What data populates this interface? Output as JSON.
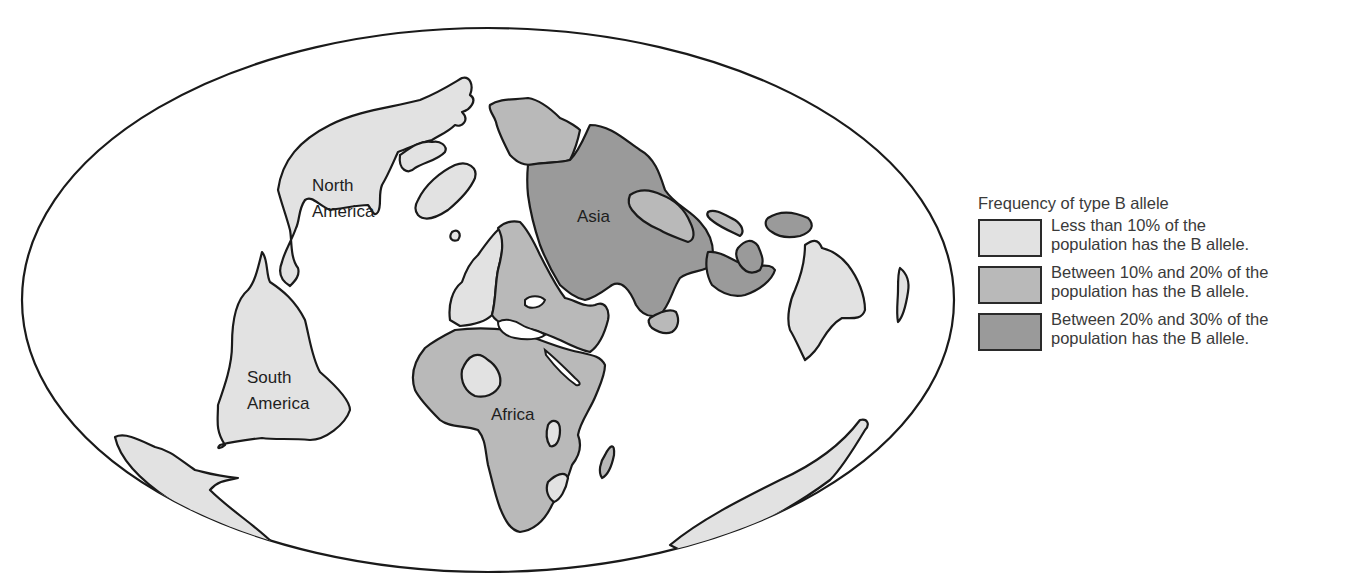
{
  "colors": {
    "low": "#e2e2e2",
    "mid": "#b9b9b9",
    "high": "#9a9a9a",
    "outline": "#1a1a1a",
    "ocean": "#ffffff"
  },
  "map": {
    "projection_outline": "ellipse",
    "labels": {
      "north_america_1": "North",
      "north_america_2": "America",
      "south_america_1": "South",
      "south_america_2": "America",
      "asia": "Asia",
      "africa": "Africa"
    },
    "regions": [
      {
        "name": "North America",
        "category": "low"
      },
      {
        "name": "South America",
        "category": "low"
      },
      {
        "name": "Greenland",
        "category": "low"
      },
      {
        "name": "Western Europe",
        "category": "low"
      },
      {
        "name": "Eastern Europe / Middle East",
        "category": "mid"
      },
      {
        "name": "Northern Siberia",
        "category": "mid"
      },
      {
        "name": "Central & South Asia",
        "category": "high"
      },
      {
        "name": "Northeast Asia",
        "category": "mid"
      },
      {
        "name": "Southeast Asia / Indonesia",
        "category": "high"
      },
      {
        "name": "Africa",
        "category": "mid"
      },
      {
        "name": "Sahara patch",
        "category": "low"
      },
      {
        "name": "Madagascar",
        "category": "mid"
      },
      {
        "name": "Australia",
        "category": "low"
      },
      {
        "name": "Antarctica",
        "category": "low"
      }
    ]
  },
  "legend": {
    "title": "Frequency of type B allele",
    "items": [
      {
        "key": "low",
        "line1": "Less than 10% of the",
        "line2": "population has the B allele."
      },
      {
        "key": "mid",
        "line1": "Between 10% and 20% of the",
        "line2": "population has the B allele."
      },
      {
        "key": "high",
        "line1": "Between 20% and 30% of the",
        "line2": "population has the B allele."
      }
    ]
  }
}
